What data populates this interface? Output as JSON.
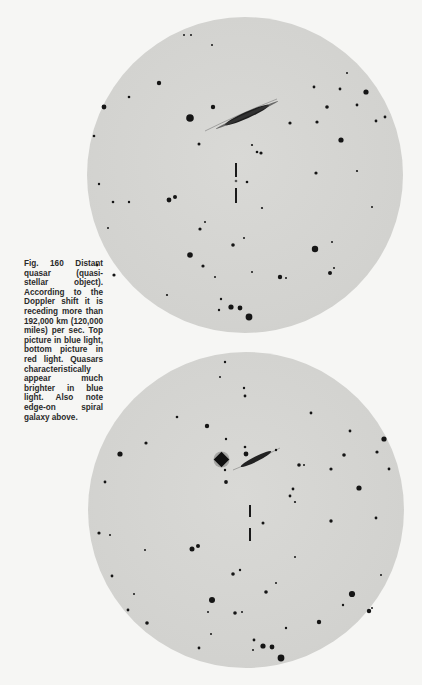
{
  "figure": {
    "number_label": "Fig. 160",
    "caption": "Fig. 160 Distant quasar (quasi-stellar object). According to the Doppler shift it is receding more than 192,000 km (120,000 miles) per sec. Top picture in blue light, bottom picture in red light. Quasars characteristically appear much brighter in blue light. Also note edge-on spiral galaxy above."
  },
  "plates": {
    "top": {
      "description": "Photographic plate in blue light",
      "background_color": "#d3d3d0",
      "star_color": "#1a1a1a",
      "quasar_marker": {
        "x": 149,
        "top_bar": [
          146,
          160
        ],
        "bottom_bar": [
          171,
          185
        ],
        "quasar_dot": [
          149,
          164
        ]
      },
      "galaxy": {
        "from": [
          126,
          110
        ],
        "to": [
          188,
          84
        ]
      }
    },
    "bottom": {
      "description": "Photographic plate in red light",
      "background_color": "#d3d3d0",
      "star_color": "#1a1a1a",
      "quasar_marker": {
        "x": 162,
        "top_bar": [
          153,
          165
        ],
        "bottom_bar": [
          176,
          189
        ]
      },
      "galaxy": {
        "from": [
          150,
          115
        ],
        "to": [
          184,
          98
        ]
      },
      "bright_star": [
        134,
        108
      ]
    }
  },
  "colors": {
    "page_background": "#f6f6f4",
    "caption_text": "#2a2a2a"
  }
}
